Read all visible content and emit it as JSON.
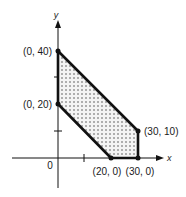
{
  "diagram": {
    "type": "feasible-region",
    "axes": {
      "x_label": "x",
      "y_label": "y",
      "origin_label": "0"
    },
    "vertices": [
      {
        "label": "(0, 40)",
        "x": 0,
        "y": 40
      },
      {
        "label": "(0, 20)",
        "x": 0,
        "y": 20
      },
      {
        "label": "(20, 0)",
        "x": 20,
        "y": 0
      },
      {
        "label": "(30, 0)",
        "x": 30,
        "y": 0
      },
      {
        "label": "(30, 10)",
        "x": 30,
        "y": 10
      }
    ],
    "ticks": {
      "x": [
        10,
        20,
        30
      ],
      "y": [
        10,
        20,
        30,
        40
      ]
    },
    "colors": {
      "stroke": "#111111",
      "fill_dots": "#555555",
      "fill_bg": "#f2f2f2"
    }
  }
}
